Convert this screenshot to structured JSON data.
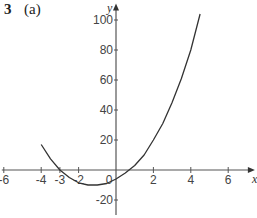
{
  "question": {
    "number": "3",
    "part": "(a)"
  },
  "chart_data": {
    "type": "line",
    "title": "",
    "xlabel": "x",
    "ylabel": "y",
    "xlim": [
      -6,
      7
    ],
    "ylim": [
      -30,
      105
    ],
    "x_ticks": [
      -6,
      -4,
      -3,
      -2,
      0,
      2,
      4,
      6
    ],
    "x_tick_labels": [
      "-6",
      "-4",
      "-3",
      "-2",
      "0",
      "2",
      "4",
      "6"
    ],
    "y_ticks": [
      -20,
      20,
      40,
      60,
      80,
      100
    ],
    "y_tick_labels": [
      "-20",
      "20",
      "40",
      "60",
      "80",
      "100"
    ],
    "grid": false,
    "series": [
      {
        "name": "curve",
        "x": [
          -4,
          -3.5,
          -3,
          -2.5,
          -2,
          -1.5,
          -1,
          -0.5,
          0,
          0.5,
          1,
          1.5,
          2,
          2.5,
          3,
          3.5,
          4,
          4.5
        ],
        "y": [
          17,
          7.5,
          0,
          -5,
          -8.5,
          -10,
          -10,
          -9,
          -6,
          -2,
          3,
          10,
          20,
          31,
          45,
          61,
          80,
          104
        ]
      }
    ]
  }
}
